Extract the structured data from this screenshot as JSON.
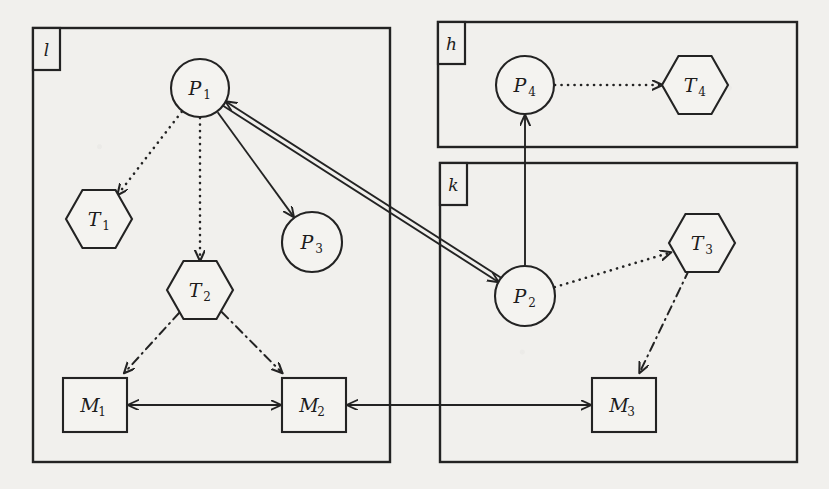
{
  "diagram": {
    "title": "Distributed process-task-machine allocation graph",
    "background_color": "#f1f0ed",
    "stroke_color": "#232323",
    "containers": [
      {
        "id": "l",
        "label": "l",
        "x": 33,
        "y": 28,
        "w": 357,
        "h": 434
      },
      {
        "id": "h",
        "label": "h",
        "x": 438,
        "y": 22,
        "w": 359,
        "h": 125
      },
      {
        "id": "k",
        "label": "k",
        "x": 440,
        "y": 163,
        "w": 357,
        "h": 299
      }
    ],
    "nodes": [
      {
        "id": "P1",
        "label": "P",
        "sub": "1",
        "shape": "circle",
        "cx": 200,
        "cy": 88,
        "r": 29
      },
      {
        "id": "P3",
        "label": "P",
        "sub": "3",
        "shape": "circle",
        "cx": 312,
        "cy": 242,
        "r": 30
      },
      {
        "id": "P2",
        "label": "P",
        "sub": "2",
        "shape": "circle",
        "cx": 525,
        "cy": 296,
        "r": 30
      },
      {
        "id": "P4",
        "label": "P",
        "sub": "4",
        "shape": "circle",
        "cx": 525,
        "cy": 85,
        "r": 29
      },
      {
        "id": "T1",
        "label": "T",
        "sub": "1",
        "shape": "hexagon",
        "cx": 99,
        "cy": 219,
        "r": 33
      },
      {
        "id": "T2",
        "label": "T",
        "sub": "2",
        "shape": "hexagon",
        "cx": 200,
        "cy": 290,
        "r": 33
      },
      {
        "id": "T3",
        "label": "T",
        "sub": "3",
        "shape": "hexagon",
        "cx": 702,
        "cy": 243,
        "r": 33
      },
      {
        "id": "T4",
        "label": "T",
        "sub": "4",
        "shape": "hexagon",
        "cx": 695,
        "cy": 85,
        "r": 33
      },
      {
        "id": "M1",
        "label": "M",
        "sub": "1",
        "shape": "square",
        "cx": 95,
        "cy": 405,
        "r": 32
      },
      {
        "id": "M2",
        "label": "M",
        "sub": "2",
        "shape": "square",
        "cx": 314,
        "cy": 405,
        "r": 32
      },
      {
        "id": "M3",
        "label": "M",
        "sub": "3",
        "shape": "square",
        "cx": 624,
        "cy": 405,
        "r": 32
      }
    ],
    "edges": [
      {
        "id": "P1-T1",
        "from": "P1",
        "to": "T1",
        "style": "dotted",
        "arrow": "to"
      },
      {
        "id": "P1-T2",
        "from": "P1",
        "to": "T2",
        "style": "dotted",
        "arrow": "to"
      },
      {
        "id": "P1-P3",
        "from": "P1",
        "to": "P3",
        "style": "solid",
        "arrow": "to"
      },
      {
        "id": "P1-P2",
        "from": "P1",
        "to": "P2",
        "style": "solid",
        "arrow": "both"
      },
      {
        "id": "T2-M1",
        "from": "T2",
        "to": "M1",
        "style": "dashdot",
        "arrow": "to"
      },
      {
        "id": "T2-M2",
        "from": "T2",
        "to": "M2",
        "style": "dashdot",
        "arrow": "to"
      },
      {
        "id": "M1-M2",
        "from": "M1",
        "to": "M2",
        "style": "solid",
        "arrow": "both"
      },
      {
        "id": "M3-M2",
        "from": "M3",
        "to": "M2",
        "style": "solid",
        "arrow": "both"
      },
      {
        "id": "P2-P4",
        "from": "P2",
        "to": "P4",
        "style": "solid",
        "arrow": "to"
      },
      {
        "id": "P4-T4",
        "from": "P4",
        "to": "T4",
        "style": "dotted",
        "arrow": "to"
      },
      {
        "id": "P2-T3",
        "from": "P2",
        "to": "T3",
        "style": "dotted",
        "arrow": "to"
      },
      {
        "id": "T3-M3",
        "from": "T3",
        "to": "M3",
        "style": "dashdot",
        "arrow": "to"
      }
    ]
  }
}
